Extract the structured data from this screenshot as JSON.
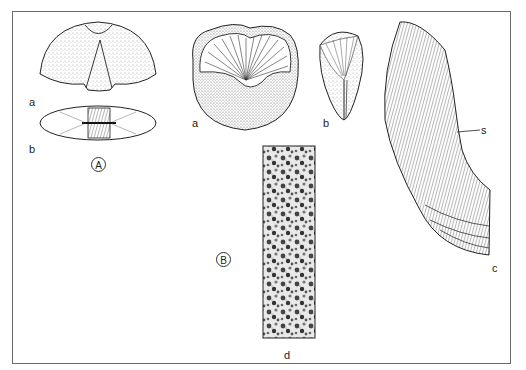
{
  "figure": {
    "group_labels": {
      "A": "A",
      "B": "B"
    },
    "panel_labels": {
      "A_a": "a",
      "A_b": "b",
      "B_a": "a",
      "B_b": "b",
      "B_c": "c",
      "B_d": "d",
      "s_marker": "s"
    },
    "colors": {
      "ink": "#222222",
      "frame": "#6a6a6a",
      "background": "#ffffff"
    }
  }
}
